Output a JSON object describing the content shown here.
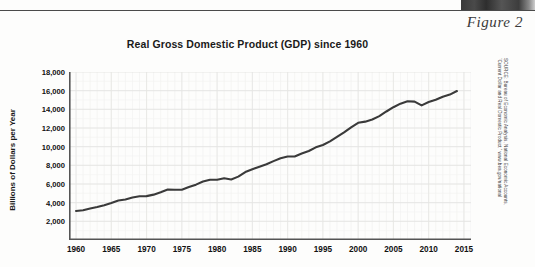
{
  "figure": {
    "label": "Figure 2"
  },
  "chart_data": {
    "type": "line",
    "title": "Real Gross Domestic Product (GDP) since 1960",
    "xlabel": "",
    "ylabel": "Billions of Dollars per Year",
    "xlim": [
      1959,
      2016
    ],
    "ylim": [
      0,
      18000
    ],
    "grid": true,
    "legend": "none",
    "y_ticks": [
      "2,000",
      "4,000",
      "6,000",
      "8,000",
      "10,000",
      "12,000",
      "14,000",
      "16,000",
      "18,000"
    ],
    "y_tick_values": [
      2000,
      4000,
      6000,
      8000,
      10000,
      12000,
      14000,
      16000,
      18000
    ],
    "x_ticks": [
      "1960",
      "1965",
      "1970",
      "1975",
      "1980",
      "1985",
      "1990",
      "1995",
      "2000",
      "2005",
      "2010",
      "2015"
    ],
    "x_tick_values": [
      1960,
      1965,
      1970,
      1975,
      1980,
      1985,
      1990,
      1995,
      2000,
      2005,
      2010,
      2015
    ],
    "x_minor_tick_step": 1,
    "line_color": "#3a3a3a",
    "series": [
      {
        "name": "Real GDP",
        "x": [
          1960,
          1961,
          1962,
          1963,
          1964,
          1965,
          1966,
          1967,
          1968,
          1969,
          1970,
          1971,
          1972,
          1973,
          1974,
          1975,
          1976,
          1977,
          1978,
          1979,
          1980,
          1981,
          1982,
          1983,
          1984,
          1985,
          1986,
          1987,
          1988,
          1989,
          1990,
          1991,
          1992,
          1993,
          1994,
          1995,
          1996,
          1997,
          1998,
          1999,
          2000,
          2001,
          2002,
          2003,
          2004,
          2005,
          2006,
          2007,
          2008,
          2009,
          2010,
          2011,
          2012,
          2013,
          2014
        ],
        "values": [
          3110,
          3190,
          3380,
          3530,
          3730,
          3970,
          4230,
          4340,
          4550,
          4690,
          4700,
          4860,
          5120,
          5410,
          5390,
          5380,
          5670,
          5930,
          6260,
          6460,
          6450,
          6610,
          6490,
          6790,
          7280,
          7580,
          7850,
          8110,
          8450,
          8760,
          8950,
          8950,
          9270,
          9530,
          9930,
          10180,
          10570,
          11040,
          11530,
          12070,
          12560,
          12680,
          12910,
          13270,
          13770,
          14230,
          14610,
          14870,
          14830,
          14420,
          14780,
          15020,
          15350,
          15580,
          15960
        ]
      }
    ],
    "source": {
      "line1": "SOURCE: Bureau of Economic Analysis, National Economic Accounts,",
      "line2": "“Current Dollar and Real Domestic Product,” www.bea.gov/national"
    }
  }
}
